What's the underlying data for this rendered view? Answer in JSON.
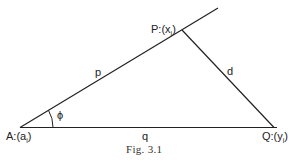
{
  "figure": {
    "caption": "Fig. 3.1",
    "points": {
      "A": {
        "label": "A:(a",
        "sub": "i",
        "close": ")"
      },
      "P": {
        "label": "P:(x",
        "sub": "i",
        "close": ")"
      },
      "Q": {
        "label": "Q:(y",
        "sub": "i",
        "close": ")"
      }
    },
    "edges": {
      "p": "p",
      "d": "d",
      "q": "q"
    },
    "angle": "ϕ",
    "colors": {
      "line": "#222222",
      "background": "#ffffff"
    }
  }
}
